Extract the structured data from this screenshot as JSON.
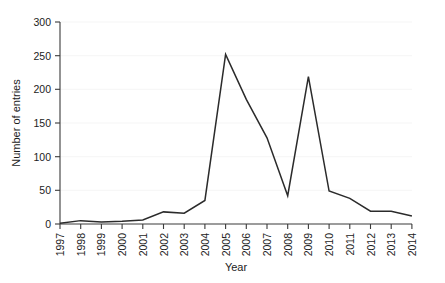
{
  "chart_data": {
    "type": "line",
    "title": "",
    "xlabel": "Year",
    "ylabel": "Number of entries",
    "categories": [
      "1997",
      "1998",
      "1999",
      "2000",
      "2001",
      "2002",
      "2003",
      "2004",
      "2005",
      "2006",
      "2007",
      "2008",
      "2009",
      "2010",
      "2011",
      "2012",
      "2013",
      "2014"
    ],
    "values": [
      1,
      5,
      3,
      4,
      6,
      18,
      16,
      35,
      252,
      185,
      128,
      42,
      219,
      49,
      38,
      19,
      19,
      12
    ],
    "series": [
      {
        "name": "Number of entries",
        "values": [
          1,
          5,
          3,
          4,
          6,
          18,
          16,
          35,
          252,
          185,
          128,
          42,
          219,
          49,
          38,
          19,
          19,
          12
        ]
      }
    ],
    "ylim": [
      0,
      300
    ],
    "yticks": [
      0,
      50,
      100,
      150,
      200,
      250,
      300
    ],
    "ytick_labels": [
      "0",
      "50",
      "100",
      "150",
      "200",
      "250",
      "300"
    ],
    "xtick_labels": [
      "1997",
      "1998",
      "1999",
      "2000",
      "2001",
      "2002",
      "2003",
      "2004",
      "2005",
      "2006",
      "2007",
      "2008",
      "2009",
      "2010",
      "2011",
      "2012",
      "2013",
      "2014"
    ],
    "xtick_rotation_deg": 90,
    "grid": false,
    "legend": null,
    "legend_position": "none",
    "line_color": "#2b2b2b",
    "background_color": "#ffffff",
    "axis_color": "#3a3a3a"
  },
  "annotations": {
    "peak_2005_label": "252",
    "peak_2009_label": "219",
    "trough_2008_label": "42"
  }
}
